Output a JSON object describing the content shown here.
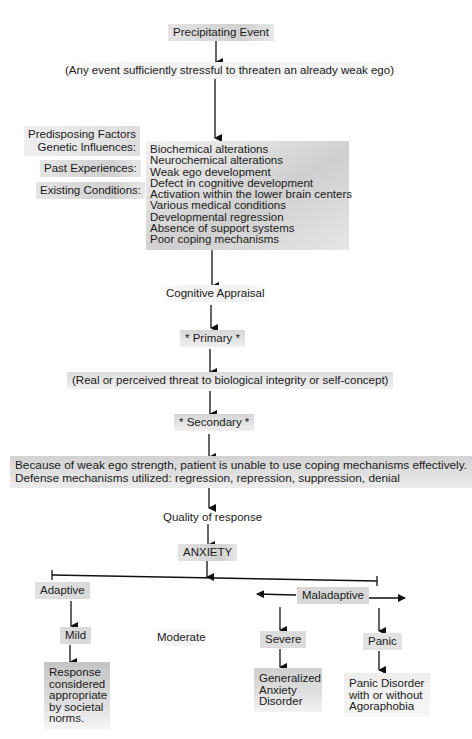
{
  "diagram": {
    "title_fragment": "",
    "precipitating_event": "Precipitating Event",
    "precipitating_note": "(Any event sufficiently stressful to threaten an already weak ego)",
    "predisposing_factors": {
      "heading": "Predisposing Factors",
      "labels": [
        "Genetic Influences:",
        "Past Experiences:",
        "Existing Conditions:"
      ]
    },
    "factors_list": [
      "Biochemical alterations",
      "Neurochemical alterations",
      "Weak ego development",
      "Defect in cognitive development",
      "Activation within the lower brain centers",
      "Various medical conditions",
      "Developmental regression",
      "Absence of support systems",
      "Poor coping mechanisms"
    ],
    "cognitive_appraisal": "Cognitive Appraisal",
    "primary": "* Primary *",
    "primary_note": "(Real or perceived threat to biological integrity or self-concept)",
    "secondary": "* Secondary *",
    "secondary_note": [
      "Because of weak ego strength, patient is unable to use coping mechanisms effectively.",
      "Defense mechanisms utilized: regression, repression, suppression, denial"
    ],
    "quality_of_response": "Quality of response",
    "anxiety": "ANXIETY",
    "adaptive": "Adaptive",
    "maladaptive": "Maladaptive",
    "levels": {
      "mild": "Mild",
      "moderate": "Moderate",
      "severe": "Severe",
      "panic": "Panic"
    },
    "outcomes": {
      "mild": [
        "Response",
        "considered",
        "appropriate",
        "by societal",
        "norms."
      ],
      "severe": [
        "Generalized",
        "Anxiety",
        "Disorder"
      ],
      "panic": [
        "Panic Disorder",
        "with or without",
        "Agoraphobia"
      ]
    },
    "colors": {
      "line": "#111111",
      "box_shade": "#d4d4d4",
      "background": "#ffffff"
    }
  }
}
